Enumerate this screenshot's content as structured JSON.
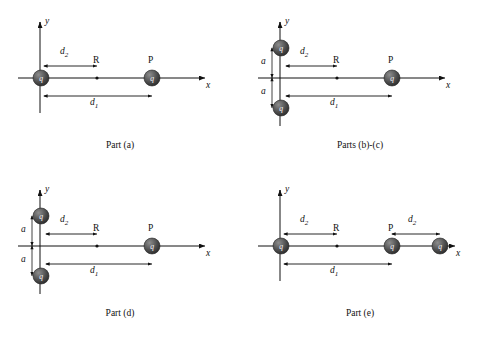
{
  "figure": {
    "title_present": false,
    "background": "#ffffff",
    "line_color": "#111111",
    "charge_fill": "#4a4a4a",
    "charge_label": "q",
    "axis_labels": {
      "x": "x",
      "y": "y"
    }
  },
  "panels": [
    {
      "id": "a",
      "caption": "Part (a)",
      "labels": {
        "y_axis": "y",
        "x_axis": "x",
        "d2": "d",
        "d2_sub": "2",
        "d1": "d",
        "d1_sub": "1",
        "R": "R",
        "P": "P",
        "a": ""
      },
      "charges": [
        {
          "label": "q",
          "role": "left-charge"
        },
        {
          "label": "q",
          "role": "right-charge"
        }
      ],
      "points": [
        "midpoint-R"
      ]
    },
    {
      "id": "bc",
      "caption": "Parts (b)-(c)",
      "labels": {
        "y_axis": "y",
        "x_axis": "x",
        "d2": "d",
        "d2_sub": "2",
        "d1": "d",
        "d1_sub": "1",
        "R": "R",
        "P": "P",
        "a_top": "a",
        "a_bottom": "a"
      },
      "charges": [
        {
          "label": "q",
          "role": "upper-left-charge"
        },
        {
          "label": "q",
          "role": "lower-left-charge"
        },
        {
          "label": "q",
          "role": "right-charge"
        }
      ],
      "points": [
        "midpoint-R"
      ]
    },
    {
      "id": "d",
      "caption": "Part (d)",
      "labels": {
        "y_axis": "y",
        "x_axis": "x",
        "d2": "d",
        "d2_sub": "2",
        "d1": "d",
        "d1_sub": "1",
        "R": "R",
        "P": "P",
        "a_top": "a",
        "a_bottom": "a"
      },
      "charges": [
        {
          "label": "q",
          "role": "upper-left-charge"
        },
        {
          "label": "q",
          "role": "lower-left-charge"
        },
        {
          "label": "q",
          "role": "right-charge"
        }
      ],
      "points": [
        "midpoint-R"
      ]
    },
    {
      "id": "e",
      "caption": "Part (e)",
      "labels": {
        "y_axis": "y",
        "x_axis": "x",
        "d2_left": "d",
        "d2_left_sub": "2",
        "d2_right": "d",
        "d2_right_sub": "2",
        "d1": "d",
        "d1_sub": "1",
        "R": "R",
        "P": "P"
      },
      "charges": [
        {
          "label": "q",
          "role": "left-charge"
        },
        {
          "label": "q",
          "role": "middle-charge"
        },
        {
          "label": "q",
          "role": "far-right-charge"
        }
      ],
      "points": [
        "midpoint-R"
      ]
    }
  ]
}
